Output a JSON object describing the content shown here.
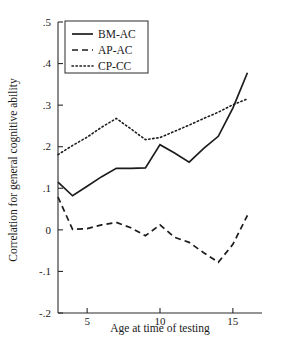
{
  "chart_data": {
    "type": "line",
    "title": "",
    "xlabel": "Age at time of testing",
    "ylabel": "Correlation for general cognitive ability",
    "xlim": [
      3,
      17
    ],
    "ylim": [
      -0.2,
      0.5
    ],
    "xticks": [
      5,
      10,
      15
    ],
    "xticklabels": [
      "5",
      "10",
      "15"
    ],
    "yticks": [
      -0.2,
      -0.1,
      0,
      0.1,
      0.2,
      0.3,
      0.4,
      0.5
    ],
    "yticklabels": [
      "-.2",
      "-.1",
      "0",
      ".1",
      ".2",
      ".3",
      ".4",
      ".5"
    ],
    "grid": false,
    "legend_position": "upper-left",
    "x": [
      3,
      4,
      5,
      6,
      7,
      8,
      9,
      10,
      11,
      12,
      13,
      14,
      15,
      16
    ],
    "series": [
      {
        "name": "BM-AC",
        "style": "solid",
        "color": "#1c1c1c",
        "values": [
          0.115,
          0.082,
          0.105,
          0.128,
          0.148,
          0.148,
          0.149,
          0.205,
          0.185,
          0.163,
          0.196,
          0.225,
          0.293,
          0.378
        ]
      },
      {
        "name": "AP-AC",
        "style": "dashed",
        "color": "#1c1c1c",
        "values": [
          0.079,
          0.001,
          0.003,
          0.012,
          0.018,
          0.005,
          -0.014,
          0.012,
          -0.018,
          -0.03,
          -0.055,
          -0.078,
          -0.035,
          0.035
        ]
      },
      {
        "name": "CP-CC",
        "style": "dotted",
        "color": "#1c1c1c",
        "values": [
          0.181,
          0.203,
          0.223,
          0.247,
          0.268,
          0.243,
          0.217,
          0.222,
          0.237,
          0.252,
          0.268,
          0.283,
          0.301,
          0.315
        ]
      }
    ],
    "legend": [
      {
        "label": "BM-AC",
        "style": "solid"
      },
      {
        "label": "AP-AC",
        "style": "dashed"
      },
      {
        "label": "CP-CC",
        "style": "dotted"
      }
    ]
  }
}
